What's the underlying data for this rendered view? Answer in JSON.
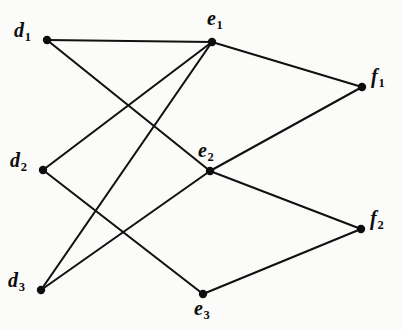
{
  "figure": {
    "width": 403,
    "height": 330,
    "background_color": "#fbfbf9",
    "ink_color": "#0d0d0d"
  },
  "chart_data": {
    "type": "diagram",
    "diagram_type": "node-link-graph",
    "title": "",
    "layout": "three-column layered graph",
    "nodes": [
      {
        "id": "d1",
        "label": "d",
        "subscript": "1",
        "x": 47,
        "y": 40,
        "label_x": 14,
        "label_y": 20,
        "layer": "d"
      },
      {
        "id": "d2",
        "label": "d",
        "subscript": "2",
        "x": 43,
        "y": 170,
        "label_x": 10,
        "label_y": 150,
        "layer": "d"
      },
      {
        "id": "d3",
        "label": "d",
        "subscript": "3",
        "x": 41,
        "y": 290,
        "label_x": 8,
        "label_y": 270,
        "layer": "d"
      },
      {
        "id": "e1",
        "label": "e",
        "subscript": "1",
        "x": 212,
        "y": 42,
        "label_x": 207,
        "label_y": 8,
        "layer": "e"
      },
      {
        "id": "e2",
        "label": "e",
        "subscript": "2",
        "x": 210,
        "y": 171,
        "label_x": 198,
        "label_y": 140,
        "layer": "e"
      },
      {
        "id": "e3",
        "label": "e",
        "subscript": "3",
        "x": 203,
        "y": 294,
        "label_x": 194,
        "label_y": 298,
        "layer": "e"
      },
      {
        "id": "f1",
        "label": "f",
        "subscript": "1",
        "x": 362,
        "y": 87,
        "label_x": 371,
        "label_y": 66,
        "layer": "f"
      },
      {
        "id": "f2",
        "label": "f",
        "subscript": "2",
        "x": 361,
        "y": 229,
        "label_x": 370,
        "label_y": 208,
        "layer": "f"
      }
    ],
    "edges": [
      {
        "from": "d1",
        "to": "e1"
      },
      {
        "from": "d1",
        "to": "e2"
      },
      {
        "from": "d2",
        "to": "e1"
      },
      {
        "from": "d2",
        "to": "e3"
      },
      {
        "from": "d3",
        "to": "e1"
      },
      {
        "from": "d3",
        "to": "e2"
      },
      {
        "from": "e1",
        "to": "f1"
      },
      {
        "from": "e2",
        "to": "f1"
      },
      {
        "from": "e2",
        "to": "f2"
      },
      {
        "from": "e3",
        "to": "f2"
      }
    ],
    "node_count": 8,
    "edge_count": 10,
    "degrees": {
      "d1": 2,
      "d2": 2,
      "d3": 2,
      "e1": 4,
      "e2": 4,
      "e3": 2,
      "f1": 2,
      "f2": 2
    }
  }
}
